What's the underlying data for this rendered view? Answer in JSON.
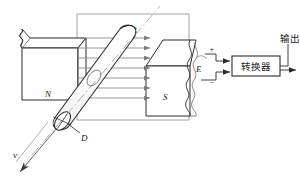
{
  "figure": {
    "kind": "electromagnetic-flowmeter-diagram",
    "background": "#ffffff",
    "line_color": "#2b2b2b",
    "field_color": "#8a8a8a",
    "frame_color": "#9a9a9a",
    "size": {
      "width": 300,
      "height": 181
    }
  },
  "labels": {
    "north_pole": "N",
    "south_pole": "S",
    "field": "B",
    "electrode": "E",
    "diameter": "D",
    "velocity": "v",
    "plus": "+",
    "minus": "−",
    "converter": "转换器",
    "output": "输出"
  },
  "field_arrows": {
    "count": 7,
    "x_start": 78,
    "x_end": 152,
    "y_values": [
      38,
      48,
      58,
      68,
      78,
      88,
      98
    ]
  },
  "frame": {
    "x": 77,
    "y": 14,
    "width": 112,
    "height": 106
  },
  "converter_box": {
    "x": 232,
    "y": 56,
    "width": 48,
    "height": 20
  }
}
